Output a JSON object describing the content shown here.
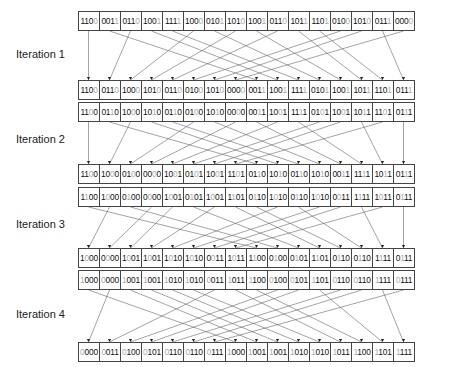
{
  "labels": [
    "Iteration 1",
    "Iteration 2",
    "Iteration 3",
    "Iteration 4"
  ],
  "rows": [
    {
      "y": 11,
      "grey": 3,
      "values": [
        "1100",
        "0011",
        "0110",
        "1001",
        "1111",
        "1000",
        "0101",
        "1010",
        "1001",
        "0110",
        "1011",
        "1101",
        "0100",
        "1010",
        "0111",
        "0000"
      ]
    },
    {
      "y": 80,
      "grey": 3,
      "values": [
        "1100",
        "0110",
        "1000",
        "1010",
        "0110",
        "0100",
        "1010",
        "0000",
        "0011",
        "1001",
        "1111",
        "0101",
        "1001",
        "1011",
        "1101",
        "0111"
      ]
    },
    {
      "y": 102,
      "grey": 2,
      "values": [
        "1100",
        "0110",
        "1000",
        "1010",
        "0110",
        "0100",
        "1010",
        "0000",
        "0011",
        "1001",
        "1111",
        "0101",
        "1001",
        "1011",
        "1101",
        "0111"
      ]
    },
    {
      "y": 164,
      "grey": 2,
      "values": [
        "1100",
        "1000",
        "0100",
        "0000",
        "1001",
        "0101",
        "1001",
        "1101",
        "0110",
        "1010",
        "0110",
        "1010",
        "0011",
        "1111",
        "1011",
        "0111"
      ]
    },
    {
      "y": 187,
      "grey": 1,
      "values": [
        "1100",
        "1000",
        "0100",
        "0000",
        "1001",
        "0101",
        "1001",
        "1101",
        "0110",
        "1010",
        "0110",
        "1010",
        "0011",
        "1111",
        "1011",
        "0111"
      ]
    },
    {
      "y": 248,
      "grey": 1,
      "values": [
        "1000",
        "0000",
        "1001",
        "1001",
        "1010",
        "1010",
        "0011",
        "1011",
        "1100",
        "0100",
        "0101",
        "1101",
        "0110",
        "0110",
        "1111",
        "0111"
      ]
    },
    {
      "y": 270,
      "grey": 0,
      "values": [
        "1000",
        "0000",
        "1001",
        "1001",
        "1010",
        "1010",
        "0011",
        "1011",
        "1100",
        "0100",
        "0101",
        "1101",
        "0110",
        "0110",
        "1111",
        "0111"
      ]
    },
    {
      "y": 342,
      "grey": 0,
      "values": [
        "0000",
        "0011",
        "0100",
        "0101",
        "0110",
        "0110",
        "0111",
        "1000",
        "1001",
        "1001",
        "1010",
        "1010",
        "1011",
        "1100",
        "1101",
        "1111"
      ]
    }
  ],
  "label_y": [
    48,
    133,
    218,
    308
  ]
}
